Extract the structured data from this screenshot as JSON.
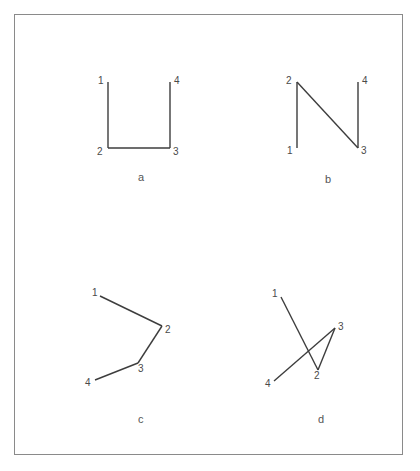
{
  "figure": {
    "background_color": "#ffffff",
    "frame_color": "#8a8a8a",
    "stroke_color": "#3d3d3d",
    "label_color": "#4a4a4a",
    "caption_color": "#555555",
    "width": 420,
    "height": 471
  },
  "panels": [
    {
      "id": "a",
      "caption": "a",
      "caption_x": 138,
      "caption_y": 172,
      "description": "U-shape open at top: vertical down from 1, across bottom to 3, vertical up to 4",
      "vertices": [
        {
          "label": "1",
          "x": 108,
          "y": 82,
          "label_x": 98,
          "label_y": 76
        },
        {
          "label": "2",
          "x": 108,
          "y": 148,
          "label_x": 97,
          "label_y": 147
        },
        {
          "label": "3",
          "x": 170,
          "y": 148,
          "label_x": 173,
          "label_y": 147
        },
        {
          "label": "4",
          "x": 170,
          "y": 82,
          "label_x": 174,
          "label_y": 76
        }
      ],
      "segments": [
        [
          0,
          1
        ],
        [
          1,
          2
        ],
        [
          2,
          3
        ]
      ]
    },
    {
      "id": "b",
      "caption": "b",
      "caption_x": 325,
      "caption_y": 174,
      "description": "N-shape: vertical up from 1 to 2, diagonal down to 3, vertical up to 4",
      "vertices": [
        {
          "label": "1",
          "x": 297,
          "y": 148,
          "label_x": 287,
          "label_y": 146
        },
        {
          "label": "2",
          "x": 297,
          "y": 82,
          "label_x": 286,
          "label_y": 76
        },
        {
          "label": "3",
          "x": 358,
          "y": 148,
          "label_x": 361,
          "label_y": 146
        },
        {
          "label": "4",
          "x": 358,
          "y": 82,
          "label_x": 362,
          "label_y": 76
        }
      ],
      "segments": [
        [
          0,
          1
        ],
        [
          1,
          2
        ],
        [
          2,
          3
        ]
      ]
    },
    {
      "id": "c",
      "caption": "c",
      "caption_x": 138,
      "caption_y": 414,
      "description": "Open zigzag chevron: 1 down-right to 2, back down-left to 3, down-left to 4",
      "vertices": [
        {
          "label": "1",
          "x": 100,
          "y": 296,
          "label_x": 92,
          "label_y": 288
        },
        {
          "label": "2",
          "x": 162,
          "y": 326,
          "label_x": 165,
          "label_y": 325
        },
        {
          "label": "3",
          "x": 138,
          "y": 363,
          "label_x": 138,
          "label_y": 364
        },
        {
          "label": "4",
          "x": 95,
          "y": 380,
          "label_x": 85,
          "label_y": 378
        }
      ],
      "segments": [
        [
          0,
          1
        ],
        [
          1,
          2
        ],
        [
          2,
          3
        ]
      ]
    },
    {
      "id": "d",
      "caption": "d",
      "caption_x": 318,
      "caption_y": 414,
      "description": "Self-crossing path: 1 down-right to 2, up-right to 3, down-left to 4 crossing segment 1-2",
      "vertices": [
        {
          "label": "1",
          "x": 281,
          "y": 297,
          "label_x": 272,
          "label_y": 289
        },
        {
          "label": "2",
          "x": 318,
          "y": 370,
          "label_x": 314,
          "label_y": 371
        },
        {
          "label": "3",
          "x": 335,
          "y": 328,
          "label_x": 338,
          "label_y": 322
        },
        {
          "label": "4",
          "x": 274,
          "y": 381,
          "label_x": 265,
          "label_y": 379
        }
      ],
      "segments": [
        [
          0,
          1
        ],
        [
          1,
          2
        ],
        [
          2,
          3
        ]
      ]
    }
  ]
}
